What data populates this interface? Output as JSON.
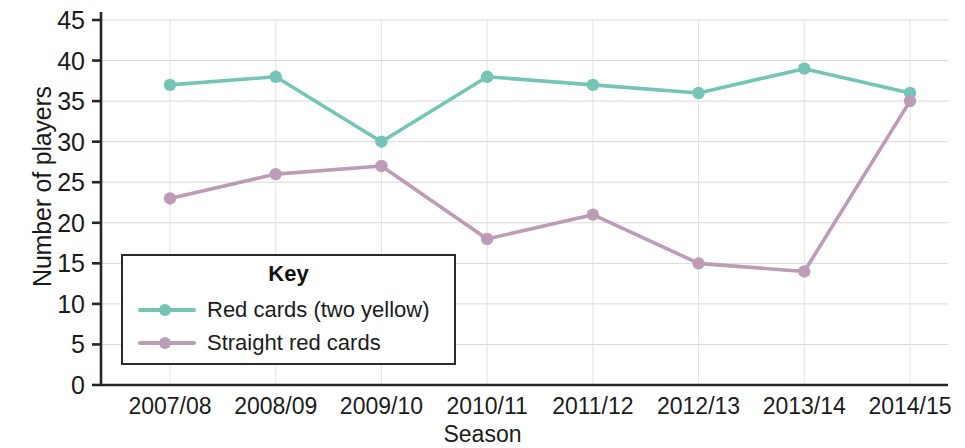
{
  "chart_data": {
    "type": "line",
    "title": "",
    "xlabel": "Season",
    "ylabel": "Number of players",
    "categories": [
      "2007/08",
      "2008/09",
      "2009/10",
      "2010/11",
      "2011/12",
      "2012/13",
      "2013/14",
      "2014/15"
    ],
    "series": [
      {
        "name": "Red cards (two yellow)",
        "color": "#74C5B6",
        "values": [
          37,
          38,
          30,
          38,
          37,
          36,
          39,
          36
        ]
      },
      {
        "name": "Straight red cards",
        "color": "#BC9CB6",
        "values": [
          23,
          26,
          27,
          18,
          21,
          15,
          14,
          35
        ]
      }
    ],
    "ylim": [
      0,
      45
    ],
    "ytick_values": [
      0,
      5,
      10,
      15,
      20,
      25,
      30,
      35,
      40,
      45
    ],
    "ytick_labels": [
      "0",
      "5",
      "10",
      "15",
      "20",
      "25",
      "30",
      "35",
      "40",
      "45"
    ],
    "grid": true,
    "grid_axis": "both",
    "legend_position": "lower-left-inside"
  },
  "legend": {
    "title": "Key",
    "entries": [
      {
        "label": "Red cards (two yellow)",
        "color": "#74C5B6"
      },
      {
        "label": "Straight red cards",
        "color": "#BC9CB6"
      }
    ]
  },
  "axes": {
    "x_title": "Season",
    "y_title": "Number of players"
  },
  "colors": {
    "series_1": "#74C5B6",
    "series_2": "#BC9CB6",
    "grid": "#d8d8d8",
    "axis": "#262626",
    "text": "#1b1b1b",
    "background": "#ffffff"
  }
}
